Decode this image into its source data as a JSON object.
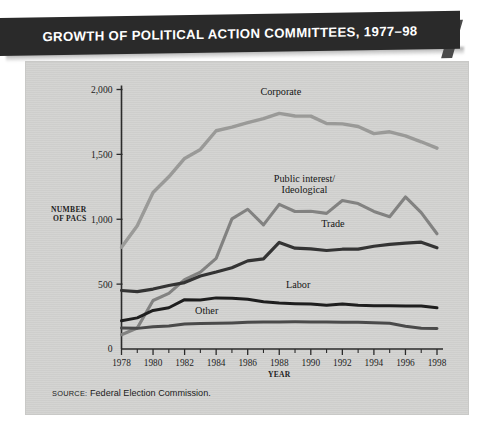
{
  "banner": {
    "title": "GROWTH OF POLITICAL ACTION COMMITTEES, 1977–98",
    "background": "#2a2a2a",
    "text_color": "#ffffff"
  },
  "figure": {
    "background": "#d3d3d1",
    "page_background": "#ffffff"
  },
  "source_note": {
    "keyword": "SOURCE:",
    "text": "Federal Election Commission."
  },
  "axes": {
    "y_title_line1": "NUMBER",
    "y_title_line2": "OF PACS",
    "x_title": "YEAR",
    "y_ticks": [
      "0",
      "500",
      "1,000",
      "1,500",
      "2,000"
    ],
    "x_ticks": [
      "1978",
      "1980",
      "1982",
      "1984",
      "1986",
      "1988",
      "1990",
      "1992",
      "1994",
      "1996",
      "1998"
    ]
  },
  "chart_data": {
    "type": "line",
    "title": "GROWTH OF POLITICAL ACTION COMMITTEES, 1977–98",
    "xlabel": "YEAR",
    "ylabel": "NUMBER OF PACS",
    "xlim": [
      1978,
      1998
    ],
    "ylim": [
      0,
      2000
    ],
    "ytick_values": [
      0,
      500,
      1000,
      1500,
      2000
    ],
    "xtick_values": [
      1978,
      1980,
      1982,
      1984,
      1986,
      1988,
      1990,
      1992,
      1994,
      1996,
      1998
    ],
    "minor_xticks": "every year",
    "grid": false,
    "legend": "inline labels on curves",
    "x": [
      1978,
      1979,
      1980,
      1981,
      1982,
      1983,
      1984,
      1985,
      1986,
      1987,
      1988,
      1989,
      1990,
      1991,
      1992,
      1993,
      1994,
      1995,
      1996,
      1997,
      1998
    ],
    "series": [
      {
        "name": "Corporate",
        "color": "#9a9a98",
        "width": 3.4,
        "label_x": 1988.1,
        "label_y": 1960,
        "values": [
          785,
          950,
          1206,
          1327,
          1469,
          1538,
          1682,
          1710,
          1744,
          1775,
          1816,
          1796,
          1795,
          1738,
          1735,
          1715,
          1660,
          1674,
          1642,
          1597,
          1548
        ]
      },
      {
        "name": "Public interest/\nIdeological",
        "label_lines": [
          "Public interest/",
          "Ideological"
        ],
        "color": "#828281",
        "width": 3.1,
        "label_x": 1989.6,
        "label_y": 1285,
        "values": [
          110,
          162,
          374,
          429,
          535,
          592,
          698,
          1003,
          1077,
          957,
          1115,
          1060,
          1062,
          1045,
          1145,
          1121,
          1060,
          1020,
          1172,
          1051,
          888
        ]
      },
      {
        "name": "Trade",
        "color": "#343434",
        "width": 3.2,
        "label_x": 1991.4,
        "label_y": 940,
        "values": [
          451,
          442,
          462,
          489,
          512,
          563,
          593,
          626,
          679,
          694,
          821,
          777,
          772,
          759,
          769,
          770,
          792,
          806,
          816,
          823,
          780
        ]
      },
      {
        "name": "Labor",
        "color": "#1e1e1e",
        "width": 3.0,
        "label_x": 1989.2,
        "label_y": 470,
        "values": [
          217,
          240,
          297,
          318,
          380,
          378,
          394,
          392,
          384,
          364,
          354,
          349,
          346,
          338,
          347,
          337,
          333,
          334,
          332,
          332,
          318
        ]
      },
      {
        "name": "Other",
        "color": "#4a4a4a",
        "width": 3.0,
        "label_x": 1983.4,
        "label_y": 268,
        "values": [
          162,
          159,
          171,
          178,
          192,
          196,
          198,
          201,
          206,
          208,
          209,
          210,
          209,
          208,
          207,
          206,
          203,
          198,
          176,
          160,
          158
        ]
      }
    ]
  }
}
